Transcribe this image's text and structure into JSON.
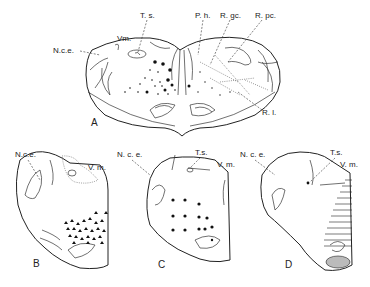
{
  "figure": {
    "panels": [
      {
        "id": "A",
        "label": "A",
        "labels": [
          "T. s.",
          "Vm.",
          "N.c.e.",
          "P. h.",
          "R. gc.",
          "R. pc.",
          "R. l."
        ]
      },
      {
        "id": "B",
        "label": "B",
        "labels": [
          "N.c.e.",
          "V. m."
        ]
      },
      {
        "id": "C",
        "label": "C",
        "labels": [
          "N. c. e.",
          "T.s.",
          "V. m."
        ]
      },
      {
        "id": "D",
        "label": "D",
        "labels": [
          "N. c. e.",
          "T.s.",
          "V. m."
        ]
      }
    ]
  },
  "a": {
    "ts": "T. s.",
    "vm": "Vm.",
    "nce": "N.c.e.",
    "ph": "P. h.",
    "rgc": "R. gc.",
    "rpc": "R. pc.",
    "rl": "R. l.",
    "panel": "A"
  },
  "b": {
    "nce": "N.c.e.",
    "vm": "V. m.",
    "panel": "B"
  },
  "c": {
    "nce": "N. c. e.",
    "ts": "T.s.",
    "vm": "V. m.",
    "panel": "C"
  },
  "d": {
    "nce": "N. c. e.",
    "ts": "T.s.",
    "vm": "V. m.",
    "panel": "D"
  }
}
